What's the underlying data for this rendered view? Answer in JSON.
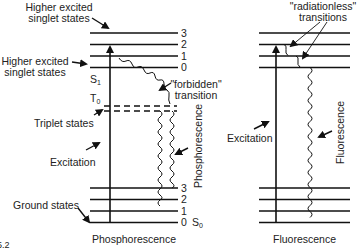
{
  "diagram": {
    "type": "Jablonski energy-level diagram",
    "caption_fragment": "15.2",
    "left_panel": {
      "title": "Phosphorescence",
      "labels": {
        "higher_excited_top_line1": "Higher excited",
        "higher_excited_top_line2": "singlet states",
        "higher_excited_mid_line1": "Higher excited",
        "higher_excited_mid_line2": "singlet states",
        "s1": "S",
        "s1_sub": "1",
        "t0": "T",
        "t0_sub": "0",
        "triplet": "Triplet states",
        "excitation": "Excitation",
        "ground": "Ground states",
        "forbidden_line1": "\"forbidden\"",
        "forbidden_line2": "transition",
        "phosphorescence_vertical": "Phosphorescence",
        "s0": "S",
        "s0_sub": "0"
      },
      "upper_levels": [
        "3",
        "2",
        "1",
        "0"
      ],
      "lower_levels": [
        "3",
        "2",
        "1",
        "0"
      ]
    },
    "right_panel": {
      "title": "Fluorescence",
      "labels": {
        "radiationless_line1": "\"radiationless\"",
        "radiationless_line2": "transitions",
        "excitation": "Excitation",
        "fluorescence_vertical": "Fluorescence"
      }
    }
  }
}
